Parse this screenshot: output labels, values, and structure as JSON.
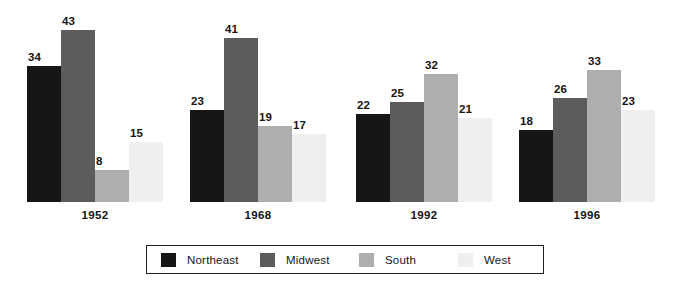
{
  "chart_data": {
    "type": "bar",
    "title": "",
    "subtitle": "",
    "xlabel": "",
    "ylabel": "",
    "categories": [
      "1952",
      "1968",
      "1992",
      "1996"
    ],
    "series": [
      {
        "name": "Northeast",
        "color": "#161616",
        "values": [
          34,
          23,
          22,
          18
        ]
      },
      {
        "name": "Midwest",
        "color": "#5c5c5c",
        "values": [
          43,
          41,
          25,
          26
        ]
      },
      {
        "name": "South",
        "color": "#aeaeae",
        "values": [
          8,
          19,
          32,
          33
        ]
      },
      {
        "name": "West",
        "color": "#efefef",
        "values": [
          15,
          17,
          21,
          23
        ]
      }
    ],
    "ylim": [
      0,
      45
    ],
    "grid": false,
    "data_labels": true,
    "legend_position": "bottom",
    "axis_visible": false,
    "tick_labels": [
      "1952",
      "1968",
      "1992",
      "1996"
    ]
  },
  "legend": {
    "items": [
      {
        "label": "Northeast",
        "swatch": "legend-swatch-northeast"
      },
      {
        "label": "Midwest",
        "swatch": "legend-swatch-midwest"
      },
      {
        "label": "South",
        "swatch": "legend-swatch-south"
      },
      {
        "label": "West",
        "swatch": "legend-swatch-west"
      }
    ]
  },
  "layout": {
    "groups": [
      {
        "label": "1952",
        "left": 27
      },
      {
        "label": "1968",
        "left": 190
      },
      {
        "label": "1992",
        "left": 356
      },
      {
        "label": "1996",
        "left": 519
      }
    ],
    "pixels_per_unit": 4.0,
    "bar_width": 34
  }
}
